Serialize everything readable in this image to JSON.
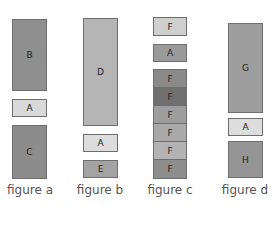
{
  "figures": [
    {
      "caption": "figure a",
      "blocks": [
        {
          "label": "B",
          "color": "#8f8f8f"
        },
        {
          "label": "A",
          "color": "#d9d9d9"
        },
        {
          "label": "C",
          "color": "#8c8c8c"
        }
      ]
    },
    {
      "caption": "figure b",
      "blocks": [
        {
          "label": "D",
          "color": "#b5b5b5"
        },
        {
          "label": "A",
          "color": "#dcdcdc"
        },
        {
          "label": "E",
          "color": "#a3a3a3"
        }
      ]
    },
    {
      "caption": "figure c",
      "blocks": [
        {
          "label": "F",
          "color": "#cfcfcf"
        },
        {
          "label": "A",
          "color": "#9a9a9a"
        },
        {
          "label": "F",
          "color": "#8a8a8a"
        },
        {
          "label": "F",
          "color": "#6f6f6f"
        },
        {
          "label": "F",
          "color": "#9d9d9d"
        },
        {
          "label": "F",
          "color": "#a9a9a9"
        },
        {
          "label": "F",
          "color": "#b3b3b3"
        },
        {
          "label": "F",
          "color": "#8d8d8d"
        }
      ]
    },
    {
      "caption": "figure d",
      "blocks": [
        {
          "label": "G",
          "color": "#9e9e9e"
        },
        {
          "label": "A",
          "color": "#dddddd"
        },
        {
          "label": "H",
          "color": "#959595"
        }
      ]
    }
  ]
}
